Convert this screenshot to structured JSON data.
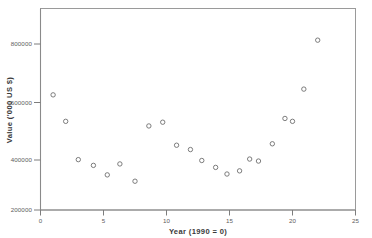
{
  "chart_data": {
    "type": "scatter",
    "title": "",
    "subtitle": "",
    "xlabel": "Year (1990 = 0)",
    "ylabel": "Value ('000 US $)",
    "xlim": [
      0,
      25
    ],
    "ylim": [
      200000,
      900000
    ],
    "xticks": [
      0,
      5,
      10,
      15,
      20,
      25
    ],
    "xtick_labels": [
      "0",
      "5",
      "10",
      "15",
      "20",
      "25"
    ],
    "yticks": [
      200000,
      400000,
      600000,
      800000
    ],
    "ytick_labels": [
      "200000",
      "400000",
      "600000",
      "800000"
    ],
    "grid": false,
    "legend": null,
    "marker": "open-circle",
    "points": [
      {
        "x": 1.0,
        "y": 600000
      },
      {
        "x": 2.0,
        "y": 508000
      },
      {
        "x": 3.0,
        "y": 375000
      },
      {
        "x": 4.2,
        "y": 355000
      },
      {
        "x": 5.3,
        "y": 322000
      },
      {
        "x": 6.3,
        "y": 360000
      },
      {
        "x": 7.5,
        "y": 300000
      },
      {
        "x": 8.6,
        "y": 492000
      },
      {
        "x": 9.7,
        "y": 505000
      },
      {
        "x": 10.8,
        "y": 425000
      },
      {
        "x": 11.9,
        "y": 410000
      },
      {
        "x": 12.8,
        "y": 372000
      },
      {
        "x": 13.9,
        "y": 348000
      },
      {
        "x": 14.8,
        "y": 325000
      },
      {
        "x": 15.8,
        "y": 336000
      },
      {
        "x": 16.6,
        "y": 377000
      },
      {
        "x": 17.3,
        "y": 370000
      },
      {
        "x": 18.4,
        "y": 430000
      },
      {
        "x": 19.4,
        "y": 518000
      },
      {
        "x": 20.0,
        "y": 508000
      },
      {
        "x": 20.9,
        "y": 620000
      },
      {
        "x": 22.0,
        "y": 790000
      }
    ],
    "fit": {
      "type": "quadratic",
      "description": "fitted trend curve",
      "a": 4900,
      "b": -118000,
      "c": 1080000,
      "vertex_x": 12.0,
      "vertex_y": 350000,
      "x_start": 0.0,
      "x_end": 23.0
    }
  },
  "axes": {
    "x_axis_name": "x-axis",
    "y_axis_name": "y-axis"
  }
}
